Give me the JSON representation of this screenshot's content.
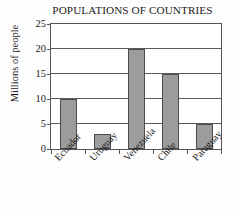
{
  "chart_data": {
    "type": "bar",
    "title": "POPULATIONS OF COUNTRIES",
    "xlabel": "",
    "ylabel": "Millions of people",
    "categories": [
      "Ecuador",
      "Uruguay",
      "Venezuela",
      "Chile",
      "Paraguay"
    ],
    "values": [
      10,
      3,
      20,
      15,
      5
    ],
    "ylim": [
      0,
      25
    ],
    "yticks": [
      0,
      5,
      10,
      15,
      20,
      25
    ],
    "ytick_labels": [
      "0",
      "5",
      "10",
      "15",
      "20",
      "25"
    ],
    "grid": true,
    "legend": false,
    "bar_color": "#9c9c9c",
    "bar_edge_color": "#4c4c4c",
    "axis_color": "#55555a",
    "background_color": "#fdfdfd",
    "text_color": "#1b1b1b"
  }
}
